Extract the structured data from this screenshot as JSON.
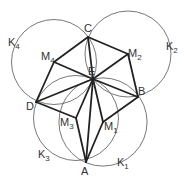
{
  "points": {
    "A": {
      "label": "A"
    },
    "B": {
      "label": "B"
    },
    "C": {
      "label": "C"
    },
    "D": {
      "label": "D"
    },
    "E": {
      "label": "E"
    },
    "M1": {
      "label": "M",
      "sub": "1"
    },
    "M2": {
      "label": "M",
      "sub": "2"
    },
    "M3": {
      "label": "M",
      "sub": "3"
    },
    "M4": {
      "label": "M",
      "sub": "4"
    }
  },
  "circles": [
    {
      "name": "K1",
      "label": "K",
      "sub": "1",
      "center": "M1",
      "through": [
        "A",
        "B",
        "E"
      ]
    },
    {
      "name": "K2",
      "label": "K",
      "sub": "2",
      "center": "M2",
      "through": [
        "B",
        "C",
        "E"
      ]
    },
    {
      "name": "K3",
      "label": "K",
      "sub": "3",
      "center": "M3",
      "through": [
        "A",
        "D",
        "E"
      ]
    },
    {
      "name": "K4",
      "label": "K",
      "sub": "4",
      "center": "M4",
      "through": [
        "C",
        "D",
        "E"
      ]
    }
  ],
  "segments": [
    [
      "A",
      "M1"
    ],
    [
      "M1",
      "B"
    ],
    [
      "B",
      "M2"
    ],
    [
      "M2",
      "C"
    ],
    [
      "C",
      "M4"
    ],
    [
      "M4",
      "D"
    ],
    [
      "D",
      "M3"
    ],
    [
      "M3",
      "A"
    ],
    [
      "E",
      "A"
    ],
    [
      "E",
      "M1"
    ],
    [
      "E",
      "B"
    ],
    [
      "E",
      "M2"
    ],
    [
      "E",
      "C"
    ],
    [
      "E",
      "M4"
    ],
    [
      "E",
      "D"
    ],
    [
      "E",
      "M3"
    ]
  ]
}
